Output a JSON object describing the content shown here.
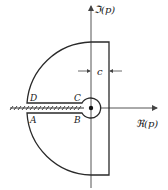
{
  "diagram": {
    "type": "contour-integration",
    "axes": {
      "imaginary_label": "ℑ(p)",
      "real_label": "ℜ(p)"
    },
    "points": {
      "A": "A",
      "B": "B",
      "C": "C",
      "D": "D"
    },
    "dimension_label": "c",
    "colors": {
      "line": "#2a2a2a",
      "axis": "#555555",
      "background": "#ffffff"
    }
  }
}
